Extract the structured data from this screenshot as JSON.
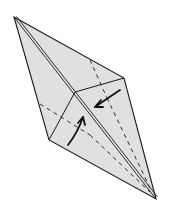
{
  "diagram": {
    "type": "origami-fold-step",
    "colors": {
      "paper": "#e6e6e6",
      "line": "#1a1a1a",
      "background": "#ffffff"
    },
    "arrows": [
      {
        "name": "arrow-fold-in-left",
        "direction": "left-down toward center crease"
      },
      {
        "name": "arrow-fold-up",
        "direction": "up toward center crease"
      }
    ]
  }
}
